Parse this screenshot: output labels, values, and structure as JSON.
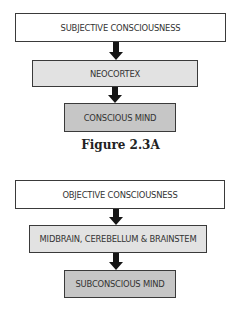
{
  "figures": [
    {
      "caption": "Figure 2.3A",
      "boxes": [
        {
          "label": "SUBJECTIVE CONSCIOUSNESS",
          "level": 0
        },
        {
          "label": "NEOCORTEX",
          "level": 1
        },
        {
          "label": "CONSCIOUS MIND",
          "level": 2
        }
      ]
    },
    {
      "caption": "",
      "boxes": [
        {
          "label": "OBJECTIVE CONSCIOUSNESS",
          "level": 0
        },
        {
          "label": "MIDBRAIN, CEREBELLUM & BRAINSTEM",
          "level": 1
        },
        {
          "label": "SUBCONSCIOUS MIND",
          "level": 2
        }
      ]
    }
  ],
  "colors": {
    "level_0_fill": "#ffffff",
    "level_1_fill": "#e2e2e2",
    "level_2_fill": "#c6c6c6",
    "border": "#3a3a3a",
    "arrow": "#151515"
  }
}
